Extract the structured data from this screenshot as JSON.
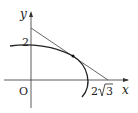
{
  "figure": {
    "axis_labels": {
      "x": "x",
      "y": "y"
    },
    "origin_label": "O",
    "y_intercept_label": "2",
    "x_intercept_label_coef": "2",
    "x_intercept_label_radicand": "3",
    "curve": "ellipse arc (upper right portion)",
    "tangent_line": "line tangent to ellipse, through (0, ~2.5) and (2√3, 0)",
    "tangent_point": "marked point on the ellipse",
    "colors": {
      "ink": "#222222",
      "line": "#555555"
    }
  }
}
